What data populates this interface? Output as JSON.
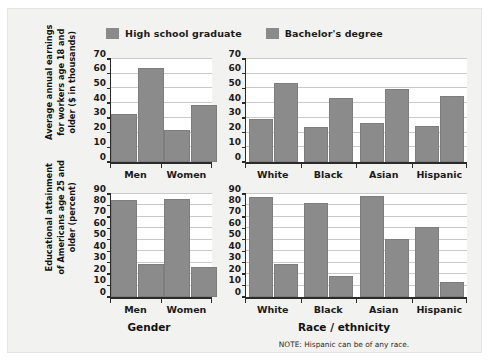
{
  "figure": {
    "note": "NOTE: Hispanic can be of any race.",
    "background_color": "#f2f2f0",
    "bar_color": "#8b8b8b",
    "gridline_color": "#c9c9c9",
    "axis_color": "#2a2a2a"
  },
  "legend": {
    "position": "top-center",
    "entries": [
      {
        "label": "High school graduate",
        "color": "#8b8b8b"
      },
      {
        "label": "Bachelor's degree",
        "color": "#8b8b8b"
      }
    ]
  },
  "axis_titles": {
    "y_top": "Average annual earnings for workers age 18 and older ($ in thousands)",
    "y_bottom": "Educational attainment of Americans age 25 and older (percent)",
    "x_left": "Gender",
    "x_right": "Race / ethnicity"
  },
  "chart_data": [
    {
      "id": "earnings-by-gender",
      "type": "bar",
      "title": "",
      "xlabel": "Gender",
      "ylabel": "Average annual earnings for workers age 18 and older ($ in thousands)",
      "categories": [
        "Men",
        "Women"
      ],
      "ylim": [
        0,
        70
      ],
      "yticks": [
        0,
        10,
        20,
        30,
        40,
        50,
        60,
        70
      ],
      "grid": true,
      "legend": "top-center",
      "series": [
        {
          "name": "High school graduate",
          "values": [
            32.5,
            21.5
          ]
        },
        {
          "name": "Bachelor's degree",
          "values": [
            64,
            38.5
          ]
        }
      ]
    },
    {
      "id": "earnings-by-race-ethnicity",
      "type": "bar",
      "title": "",
      "xlabel": "Race / ethnicity",
      "ylabel": "Average annual earnings for workers age 18 and older ($ in thousands)",
      "categories": [
        "White",
        "Black",
        "Asian",
        "Hispanic"
      ],
      "ylim": [
        0,
        70
      ],
      "yticks": [
        0,
        10,
        20,
        30,
        40,
        50,
        60,
        70
      ],
      "grid": true,
      "legend": "top-center",
      "series": [
        {
          "name": "High school graduate",
          "values": [
            29.5,
            24,
            26.5,
            24.5
          ]
        },
        {
          "name": "Bachelor's degree",
          "values": [
            53.5,
            43.5,
            49.5,
            45
          ]
        }
      ]
    },
    {
      "id": "attainment-by-gender",
      "type": "bar",
      "title": "",
      "xlabel": "Gender",
      "ylabel": "Educational attainment of Americans age 25 and older (percent)",
      "categories": [
        "Men",
        "Women"
      ],
      "ylim": [
        0,
        90
      ],
      "yticks": [
        0,
        10,
        20,
        30,
        40,
        50,
        60,
        70,
        80,
        90
      ],
      "grid": true,
      "legend": "top-center",
      "series": [
        {
          "name": "High school graduate",
          "values": [
            84.5,
            85.5
          ]
        },
        {
          "name": "Bachelor's degree",
          "values": [
            29,
            26
          ]
        }
      ]
    },
    {
      "id": "attainment-by-race-ethnicity",
      "type": "bar",
      "title": "",
      "xlabel": "Race / ethnicity",
      "ylabel": "Educational attainment of Americans age 25 and older (percent)",
      "categories": [
        "White",
        "Black",
        "Asian",
        "Hispanic"
      ],
      "ylim": [
        0,
        90
      ],
      "yticks": [
        0,
        10,
        20,
        30,
        40,
        50,
        60,
        70,
        80,
        90
      ],
      "grid": true,
      "legend": "top-center",
      "series": [
        {
          "name": "High school graduate",
          "values": [
            87,
            82,
            88.5,
            61
          ]
        },
        {
          "name": "Bachelor's degree",
          "values": [
            28.5,
            18,
            51,
            13
          ]
        }
      ]
    }
  ]
}
